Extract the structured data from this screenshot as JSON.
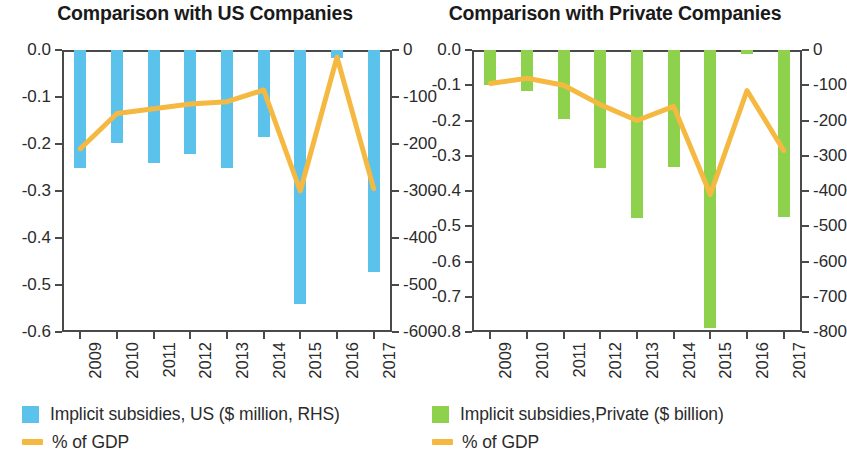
{
  "chart_data": [
    {
      "type": "bar",
      "panel": "left",
      "title": "Comparison with US Companies",
      "xlabel": "",
      "ylabel": "",
      "categories": [
        "2009",
        "2010",
        "2011",
        "2012",
        "2013",
        "2014",
        "2015",
        "2016",
        "2017"
      ],
      "left_axis": {
        "label": "% of GDP",
        "ylim": [
          -0.6,
          0.0
        ],
        "ticks": [
          "0.0",
          "-0.1",
          "-0.2",
          "-0.3",
          "-0.4",
          "-0.5",
          "-0.6"
        ],
        "tick_values": [
          0.0,
          -0.1,
          -0.2,
          -0.3,
          -0.4,
          -0.5,
          -0.6
        ]
      },
      "right_axis": {
        "label": "$ million",
        "ylim": [
          -600,
          0
        ],
        "ticks": [
          "0",
          "-100",
          "-200",
          "-300",
          "-400",
          "-500",
          "-600"
        ],
        "tick_values": [
          0,
          -100,
          -200,
          -300,
          -400,
          -500,
          -600
        ]
      },
      "grid": false,
      "legend_position": "below",
      "series": [
        {
          "name": "Implicit subsidies, US ($ million, RHS)",
          "kind": "bar",
          "axis": "right",
          "color": "#5bc2ec",
          "values": [
            -250,
            -198,
            -241,
            -222,
            -252,
            -185,
            -540,
            -18,
            -473
          ]
        },
        {
          "name": "% of GDP",
          "kind": "line",
          "axis": "left",
          "color": "#f5b942",
          "values": [
            -0.21,
            -0.135,
            -0.125,
            -0.115,
            -0.11,
            -0.085,
            -0.3,
            -0.015,
            -0.295
          ]
        }
      ]
    },
    {
      "type": "bar",
      "panel": "right",
      "title": "Comparison with Private Companies",
      "xlabel": "",
      "ylabel": "",
      "categories": [
        "2009",
        "2010",
        "2011",
        "2012",
        "2013",
        "2014",
        "2015",
        "2016",
        "2017"
      ],
      "left_axis": {
        "label": "% of GDP",
        "ylim": [
          -0.8,
          0.0
        ],
        "ticks": [
          "0.0",
          "-0.1",
          "-0.2",
          "-0.3",
          "-0.4",
          "-0.5",
          "-0.6",
          "-0.7",
          "-0.8"
        ],
        "tick_values": [
          0.0,
          -0.1,
          -0.2,
          -0.3,
          -0.4,
          -0.5,
          -0.6,
          -0.7,
          -0.8
        ]
      },
      "right_axis": {
        "label": "$ billion",
        "ylim": [
          -800,
          0
        ],
        "ticks": [
          "0",
          "-100",
          "-200",
          "-300",
          "-400",
          "-500",
          "-600",
          "-700",
          "-800"
        ],
        "tick_values": [
          0,
          -100,
          -200,
          -300,
          -400,
          -500,
          -600,
          -700,
          -800
        ]
      },
      "grid": false,
      "legend_position": "below",
      "series": [
        {
          "name": "Implicit subsidies,Private ($ billion)",
          "kind": "bar",
          "axis": "right",
          "color": "#8ed14c",
          "values": [
            -100,
            -115,
            -196,
            -335,
            -478,
            -333,
            -790,
            -10,
            -473
          ]
        },
        {
          "name": "% of GDP",
          "kind": "line",
          "axis": "left",
          "color": "#f5b942",
          "values": [
            -0.095,
            -0.08,
            -0.1,
            -0.155,
            -0.2,
            -0.16,
            -0.41,
            -0.115,
            -0.285
          ]
        }
      ]
    }
  ],
  "panels": [
    {
      "id": "left",
      "title": "Comparison with US Companies",
      "legend": [
        {
          "marker": "bar-swatch-blue",
          "label": "Implicit subsidies, US ($ million, RHS)"
        },
        {
          "marker": "line-swatch-orange",
          "label": "% of GDP"
        }
      ]
    },
    {
      "id": "right",
      "title": "Comparison with Private Companies",
      "legend": [
        {
          "marker": "bar-swatch-green",
          "label": "Implicit subsidies,Private ($ billion)"
        },
        {
          "marker": "line-swatch-orange",
          "label": "% of GDP"
        }
      ]
    }
  ]
}
